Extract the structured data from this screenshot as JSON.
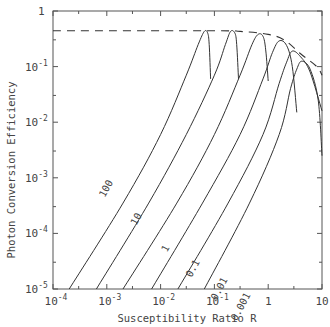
{
  "chart_data": {
    "type": "line",
    "title": "",
    "xlabel": "Susceptibility Ratio R",
    "ylabel": "Photon Conversion Efficiency",
    "xscale": "log",
    "yscale": "log",
    "xlim": [
      0.0001,
      10
    ],
    "ylim": [
      1e-05,
      1
    ],
    "grid": false,
    "legend": "inline curve labels",
    "x_ticks": [
      {
        "value": 0.0001,
        "base": "10",
        "exp": "-4"
      },
      {
        "value": 0.001,
        "base": "10",
        "exp": "-3"
      },
      {
        "value": 0.01,
        "base": "10",
        "exp": "-2"
      },
      {
        "value": 0.1,
        "base": "10",
        "exp": "-1"
      },
      {
        "value": 1,
        "base": "1",
        "exp": ""
      },
      {
        "value": 10,
        "base": "10",
        "exp": ""
      }
    ],
    "y_ticks": [
      {
        "value": 1,
        "base": "1",
        "exp": ""
      },
      {
        "value": 0.1,
        "base": "10",
        "exp": "-1"
      },
      {
        "value": 0.01,
        "base": "10",
        "exp": "-2"
      },
      {
        "value": 0.001,
        "base": "10",
        "exp": "-3"
      },
      {
        "value": 0.0001,
        "base": "10",
        "exp": "-4"
      },
      {
        "value": 1e-05,
        "base": "10",
        "exp": "-5"
      }
    ],
    "series": [
      {
        "name": "100",
        "label_at": [
          0.0011,
          0.0006
        ],
        "points": [
          [
            0.0002,
            1e-05
          ],
          [
            0.002,
            0.00035
          ],
          [
            0.01,
            0.006
          ],
          [
            0.03,
            0.07
          ],
          [
            0.05,
            0.25
          ],
          [
            0.065,
            0.43
          ],
          [
            0.075,
            0.4
          ],
          [
            0.08,
            0.25
          ],
          [
            0.085,
            0.06
          ]
        ]
      },
      {
        "name": "10",
        "label_at": [
          0.004,
          0.00017
        ],
        "points": [
          [
            0.00064,
            1e-05
          ],
          [
            0.006,
            0.00035
          ],
          [
            0.03,
            0.006
          ],
          [
            0.1,
            0.07
          ],
          [
            0.16,
            0.25
          ],
          [
            0.2,
            0.43
          ],
          [
            0.24,
            0.4
          ],
          [
            0.26,
            0.25
          ],
          [
            0.28,
            0.06
          ]
        ]
      },
      {
        "name": "1",
        "label_at": [
          0.014,
          5e-05
        ],
        "points": [
          [
            0.002,
            1e-05
          ],
          [
            0.02,
            0.00035
          ],
          [
            0.1,
            0.006
          ],
          [
            0.3,
            0.07
          ],
          [
            0.5,
            0.25
          ],
          [
            0.65,
            0.38
          ],
          [
            0.8,
            0.35
          ],
          [
            0.9,
            0.2
          ],
          [
            1.0,
            0.055
          ]
        ]
      },
      {
        "name": "0.1",
        "label_at": [
          0.045,
          2.2e-05
        ],
        "points": [
          [
            0.0068,
            1e-05
          ],
          [
            0.06,
            0.00035
          ],
          [
            0.3,
            0.006
          ],
          [
            0.8,
            0.06
          ],
          [
            1.2,
            0.18
          ],
          [
            1.6,
            0.29
          ],
          [
            2.2,
            0.24
          ],
          [
            2.8,
            0.1
          ],
          [
            3.4,
            0.015
          ]
        ]
      },
      {
        "name": "0.01",
        "label_at": [
          0.14,
          9.5e-06
        ],
        "points": [
          [
            0.021,
            1e-05
          ],
          [
            0.18,
            0.00035
          ],
          [
            0.8,
            0.006
          ],
          [
            1.6,
            0.05
          ],
          [
            2.2,
            0.12
          ],
          [
            2.8,
            0.19
          ],
          [
            4.0,
            0.15
          ],
          [
            6.0,
            0.08
          ],
          [
            10,
            0.016
          ]
        ]
      },
      {
        "name": "0.001",
        "label_at": [
          0.35,
          4.5e-06
        ],
        "points": [
          [
            0.065,
            1e-05
          ],
          [
            0.45,
            0.00035
          ],
          [
            1.6,
            0.006
          ],
          [
            2.6,
            0.04
          ],
          [
            3.4,
            0.09
          ],
          [
            4.2,
            0.125
          ],
          [
            6.0,
            0.09
          ],
          [
            8.5,
            0.025
          ],
          [
            10,
            0.0025
          ]
        ]
      }
    ],
    "envelope": {
      "style": "dashed",
      "points": [
        [
          0.0001,
          0.44
        ],
        [
          0.1,
          0.44
        ],
        [
          0.3,
          0.43
        ],
        [
          1,
          0.38
        ],
        [
          2,
          0.3
        ],
        [
          4,
          0.17
        ],
        [
          8,
          0.1
        ],
        [
          10,
          0.07
        ]
      ]
    }
  }
}
